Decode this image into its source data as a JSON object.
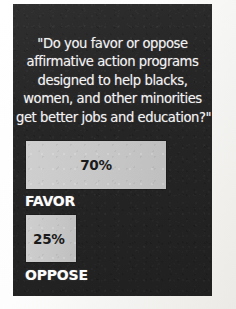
{
  "poster": {
    "background_color": "#262626",
    "text_color": "#f2f2f2",
    "bar_color": "#c9c9c9",
    "bar_value_color": "#1b1b1b"
  },
  "question": {
    "full_text": "\"Do you favor or oppose affirmative action programs designed to help blacks, women, and other minorities get better jobs and education?\"",
    "lines": [
      "\"Do you favor or oppose",
      "affirmative action programs",
      "designed to help blacks,",
      "women, and other minorities",
      "get better jobs and education?\""
    ]
  },
  "chart_data": {
    "type": "bar",
    "orientation": "horizontal",
    "title": "\"Do you favor or oppose affirmative action programs designed to help blacks, women, and other minorities get better jobs and education?\"",
    "subtitle": "",
    "xlabel": "",
    "ylabel": "",
    "xlim": [
      0,
      100
    ],
    "grid": false,
    "legend": false,
    "categories": [
      "FAVOR",
      "OPPOSE"
    ],
    "values": [
      70,
      25
    ],
    "value_labels": [
      "70%",
      "25%"
    ],
    "value_unit": "%",
    "bar_color": "#c9c9c9",
    "background_color": "#262626"
  },
  "bars": [
    {
      "label": "FAVOR",
      "value": 70,
      "value_label": "70%"
    },
    {
      "label": "OPPOSE",
      "value": 25,
      "value_label": "25%"
    }
  ]
}
